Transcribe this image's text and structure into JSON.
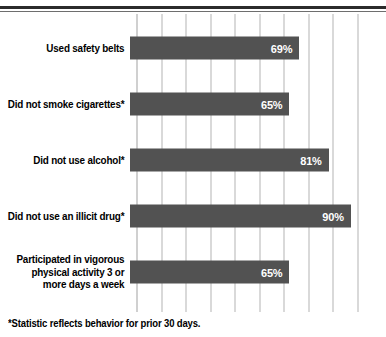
{
  "chart_data": {
    "type": "bar",
    "orientation": "horizontal",
    "title": "",
    "subtitle": "",
    "xlabel": "",
    "ylabel": "",
    "xlim": [
      0,
      95
    ],
    "grid": true,
    "gridline_interval": 10,
    "gridline_values": [
      0,
      10,
      20,
      30,
      40,
      50,
      60,
      70,
      80,
      90
    ],
    "legend": null,
    "bar_color": "#525252",
    "value_label_color": "#ffffff",
    "categories": [
      "Used safety belts",
      "Did not smoke cigarettes*",
      "Did not use alcohol*",
      "Did not use an illicit drug*",
      "Participated in vigorous physical activity 3 or more days a week"
    ],
    "values": [
      69,
      65,
      81,
      90,
      65
    ],
    "value_labels": [
      "69%",
      "65%",
      "81%",
      "90%",
      "65%"
    ],
    "annotations": [
      "*Statistic reflects behavior for prior 30 days."
    ]
  },
  "chart": {
    "footnote": "*Statistic reflects behavior for prior 30 days.",
    "rows": [
      {
        "label_lines": [
          "Used safety belts"
        ],
        "value": 69,
        "value_label": "69%"
      },
      {
        "label_lines": [
          "Did not smoke cigarettes*"
        ],
        "value": 65,
        "value_label": "65%"
      },
      {
        "label_lines": [
          "Did not use alcohol*"
        ],
        "value": 81,
        "value_label": "81%"
      },
      {
        "label_lines": [
          "Did not use an illicit drug*"
        ],
        "value": 90,
        "value_label": "90%"
      },
      {
        "label_lines": [
          "Participated in vigorous",
          "physical activity 3 or",
          "more days a week"
        ],
        "value": 65,
        "value_label": "65%"
      }
    ]
  }
}
